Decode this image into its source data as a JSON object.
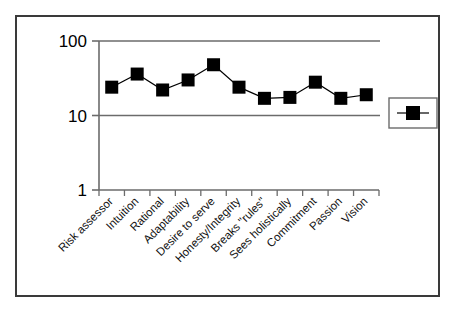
{
  "chart_data": {
    "type": "line",
    "title": "",
    "subtitle": "",
    "xlabel": "",
    "ylabel": "",
    "yscale": "log",
    "ylim": [
      1,
      100
    ],
    "ytick_labels": [
      "100",
      "10",
      "1"
    ],
    "yticks": [
      100,
      10,
      1
    ],
    "grid": true,
    "legend_position": "right",
    "legend_entries": [
      {
        "label": "",
        "marker": "filled-square",
        "color": "#000000"
      }
    ],
    "categories": [
      "Risk assessor",
      "Intuition",
      "Rational",
      "Adaptability",
      "Desire to serve",
      "Honesty/Integrity",
      "Breaks \"rules\"",
      "Sees holistically",
      "Commitment",
      "Passion",
      "Vision"
    ],
    "values": [
      24,
      36,
      22,
      30,
      48,
      24,
      17,
      17.5,
      28,
      17,
      19
    ],
    "series": [
      {
        "name": "",
        "values": [
          24,
          36,
          22,
          30,
          48,
          24,
          17,
          17.5,
          28,
          17,
          19
        ],
        "marker": "filled-square",
        "color": "#000000"
      }
    ]
  },
  "colors": {
    "frame_border": "#3a3a3a",
    "axis": "#6b6b6b",
    "gridline": "#6b6b6b",
    "marker": "#000000",
    "line": "#000000",
    "background": "#ffffff"
  }
}
